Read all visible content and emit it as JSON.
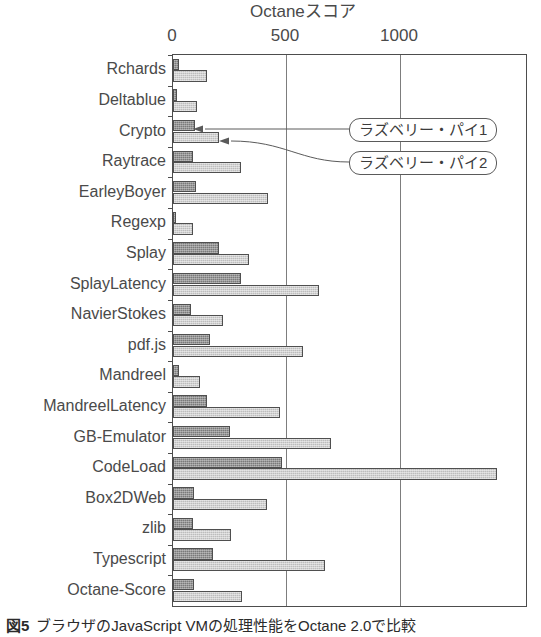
{
  "figure": {
    "caption_number": "図5",
    "caption_text": "ブラウザのJavaScript VMの処理性能をOctane 2.0で比較"
  },
  "callouts": [
    {
      "label": "ラズベリー・パイ1",
      "points_to": "Crypto-pi1-bar"
    },
    {
      "label": "ラズベリー・パイ2",
      "points_to": "Crypto-pi2-bar"
    }
  ],
  "chart_data": {
    "type": "bar",
    "orientation": "horizontal",
    "title": "Octaneスコア",
    "xlabel": "Octaneスコア",
    "ylabel": "",
    "xlim": [
      0,
      1500
    ],
    "xticks": [
      0,
      500,
      1000
    ],
    "xtick_labels": [
      "0",
      "500",
      "1000"
    ],
    "grid": true,
    "legend_position": "callout-annotations",
    "categories": [
      "Rchards",
      "Deltablue",
      "Crypto",
      "Raytrace",
      "EarleyBoyer",
      "Regexp",
      "Splay",
      "SplayLatency",
      "NavierStokes",
      "pdf.js",
      "Mandreel",
      "MandreelLatency",
      "GB-Emulator",
      "CodeLoad",
      "Box2DWeb",
      "zlib",
      "Typescript",
      "Octane-Score"
    ],
    "series": [
      {
        "name": "ラズベリー・パイ1",
        "color": "#7a7a7a",
        "values": [
          27,
          18,
          93,
          84,
          97,
          9,
          195,
          288,
          75,
          159,
          27,
          146,
          244,
          465,
          88,
          84,
          168,
          88
        ]
      },
      {
        "name": "ラズベリー・パイ2",
        "color": "#bdbdbd",
        "values": [
          146,
          102,
          195,
          288,
          403,
          84,
          323,
          620,
          212,
          553,
          115,
          456,
          673,
          1376,
          398,
          248,
          646,
          292
        ]
      }
    ]
  }
}
